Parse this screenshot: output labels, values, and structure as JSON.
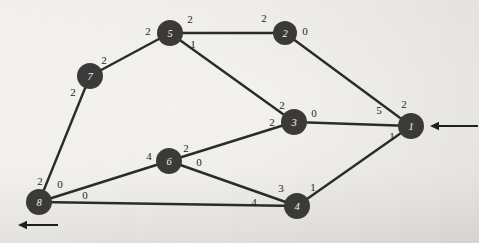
{
  "figure": {
    "type": "node-link-graph",
    "background_color": "#f2f0ec",
    "node_color": "#3b3a39",
    "node_label_color": "#f4f2ef",
    "edge_color": "#2b2b2b",
    "weight_label_color": "#1f1f1f"
  },
  "nodes": [
    {
      "id": "5",
      "label": "5",
      "x": 170,
      "y": 33,
      "r": 13
    },
    {
      "id": "2",
      "label": "2",
      "x": 285,
      "y": 33,
      "r": 12
    },
    {
      "id": "7",
      "label": "7",
      "x": 90,
      "y": 76,
      "r": 13
    },
    {
      "id": "3",
      "label": "3",
      "x": 294,
      "y": 122,
      "r": 13
    },
    {
      "id": "1",
      "label": "1",
      "x": 411,
      "y": 126,
      "r": 13
    },
    {
      "id": "6",
      "label": "6",
      "x": 169,
      "y": 161,
      "r": 13
    },
    {
      "id": "8",
      "label": "8",
      "x": 39,
      "y": 202,
      "r": 13
    },
    {
      "id": "4",
      "label": "4",
      "x": 297,
      "y": 206,
      "r": 13
    }
  ],
  "edges": [
    {
      "id": "e-7-5",
      "from": "7",
      "to": "5",
      "label_from": "2",
      "label_to": "2"
    },
    {
      "id": "e-5-2",
      "from": "5",
      "to": "2",
      "label_from": "2",
      "label_to": "2"
    },
    {
      "id": "e-5-3",
      "from": "5",
      "to": "3",
      "label_from": "1",
      "label_to": "2"
    },
    {
      "id": "e-2-1",
      "from": "2",
      "to": "1",
      "label_from": "0",
      "label_to": "5"
    },
    {
      "id": "e-3-1",
      "from": "3",
      "to": "1",
      "label_from": "0",
      "label_to": "2"
    },
    {
      "id": "e-3-6",
      "from": "3",
      "to": "6",
      "label_from": "2",
      "label_to": "2"
    },
    {
      "id": "e-7-8",
      "from": "7",
      "to": "8",
      "label_from": "2",
      "label_to": "2"
    },
    {
      "id": "e-8-6",
      "from": "8",
      "to": "6",
      "label_from": "0",
      "label_to": "4"
    },
    {
      "id": "e-8-4",
      "from": "8",
      "to": "4",
      "label_from": "0",
      "label_to": "4"
    },
    {
      "id": "e-6-4",
      "from": "6",
      "to": "4",
      "label_from": "0",
      "label_to": "3"
    },
    {
      "id": "e-4-1",
      "from": "4",
      "to": "1",
      "label_from": "1",
      "label_to": "1"
    }
  ],
  "weight_labels": [
    {
      "id": "w-7-5-a",
      "text": "2",
      "x": 104,
      "y": 60
    },
    {
      "id": "w-7-5-b",
      "text": "2",
      "x": 148,
      "y": 31
    },
    {
      "id": "w-5-2-a",
      "text": "2",
      "x": 190,
      "y": 19
    },
    {
      "id": "w-5-2-b",
      "text": "2",
      "x": 264,
      "y": 18
    },
    {
      "id": "w-5-3-a",
      "text": "1",
      "x": 193,
      "y": 44
    },
    {
      "id": "w-5-3-b",
      "text": "2",
      "x": 282,
      "y": 105
    },
    {
      "id": "w-2-1-a",
      "text": "0",
      "x": 305,
      "y": 31
    },
    {
      "id": "w-2-1-b",
      "text": "5",
      "x": 379,
      "y": 110
    },
    {
      "id": "w-3-1-a",
      "text": "0",
      "x": 314,
      "y": 113
    },
    {
      "id": "w-3-1-b",
      "text": "2",
      "x": 404,
      "y": 104
    },
    {
      "id": "w-3-6-a",
      "text": "2",
      "x": 272,
      "y": 122
    },
    {
      "id": "w-3-6-b",
      "text": "2",
      "x": 186,
      "y": 148
    },
    {
      "id": "w-7-8-a",
      "text": "2",
      "x": 73,
      "y": 92
    },
    {
      "id": "w-7-8-b",
      "text": "2",
      "x": 40,
      "y": 181
    },
    {
      "id": "w-8-6-a",
      "text": "0",
      "x": 60,
      "y": 184
    },
    {
      "id": "w-8-6-b",
      "text": "4",
      "x": 149,
      "y": 156
    },
    {
      "id": "w-8-4-a",
      "text": "0",
      "x": 85,
      "y": 195
    },
    {
      "id": "w-8-4-b",
      "text": "4",
      "x": 254,
      "y": 202
    },
    {
      "id": "w-6-4-a",
      "text": "0",
      "x": 199,
      "y": 162
    },
    {
      "id": "w-6-4-b",
      "text": "3",
      "x": 281,
      "y": 188
    },
    {
      "id": "w-4-1-a",
      "text": "1",
      "x": 313,
      "y": 187
    },
    {
      "id": "w-4-1-b",
      "text": "1",
      "x": 392,
      "y": 136
    }
  ],
  "arrows": [
    {
      "id": "arrow-into-node-1",
      "x1": 478,
      "y1": 126,
      "x2": 430,
      "y2": 126,
      "direction": "left"
    },
    {
      "id": "arrow-out-of-node-8",
      "x1": 58,
      "y1": 225,
      "x2": 18,
      "y2": 225,
      "direction": "left"
    }
  ]
}
